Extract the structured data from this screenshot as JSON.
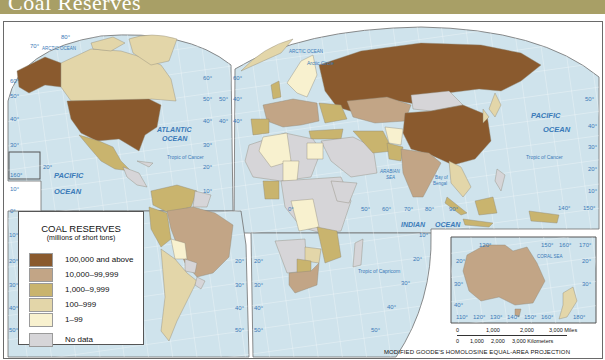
{
  "header": {
    "title": "Coal Reserves",
    "background_color": "#a89f66"
  },
  "legend": {
    "title": "COAL RESERVES",
    "subtitle": "(millions of short tons)",
    "items": [
      {
        "label": "100,000 and above",
        "color": "#8a5a2e"
      },
      {
        "label": "10,000–99,999",
        "color": "#c2a586"
      },
      {
        "label": "1,000–9,999",
        "color": "#c9b46e"
      },
      {
        "label": "100–999",
        "color": "#e3d6a9"
      },
      {
        "label": "1–99",
        "color": "#f8f1cf"
      },
      {
        "label": "No data",
        "color": "#d6d5d8"
      }
    ]
  },
  "ocean_labels": {
    "arctic_west": "ARCTIC OCEAN",
    "arctic_east": "ARCTIC OCEAN",
    "atlantic_1": "ATLANTIC",
    "atlantic_2": "OCEAN",
    "pacific_west_1": "PACIFIC",
    "pacific_west_2": "OCEAN",
    "pacific_east_1": "PACIFIC",
    "pacific_east_2": "OCEAN",
    "indian_1": "INDIAN",
    "indian_2": "OCEAN",
    "arabian_sea_1": "ARABIAN",
    "arabian_sea_2": "SEA",
    "bay_of_bengal_1": "Bay of",
    "bay_of_bengal_2": "Bengal",
    "coral_sea": "CORAL SEA"
  },
  "line_labels": {
    "arctic_circle": "Arctic Circle",
    "tropic_cancer_west": "Tropic of Cancer",
    "tropic_cancer_east": "Tropic of Cancer",
    "tropic_capricorn": "Tropic of Capricorn"
  },
  "graticule_labels": {
    "west_lat": [
      "80°",
      "70°",
      "60°",
      "50°",
      "40°",
      "30°",
      "20°",
      "160°",
      "10°",
      "0°",
      "10°",
      "20°",
      "30°",
      "40°",
      "50°"
    ],
    "atlantic_lat": [
      "60°",
      "50°",
      "40°",
      "30°",
      "20°",
      "10°"
    ],
    "sa_east_lat": [
      "20°",
      "30°",
      "40°",
      "50°"
    ],
    "africa_west_lat": [
      "60°",
      "50°",
      "40°",
      "30°",
      "20°",
      "10°",
      "0°",
      "10°",
      "20°",
      "30°",
      "40°",
      "50°"
    ],
    "indian_lon": [
      "50°",
      "60°",
      "70°",
      "80°",
      "90°"
    ],
    "east_lat": [
      "50°",
      "40°",
      "30°",
      "20°",
      "10°"
    ],
    "east_lon": [
      "140°",
      "150°"
    ],
    "africa_south_lat": [
      "10°",
      "20°",
      "30°",
      "40°",
      "50°"
    ],
    "australia_top": [
      "120°",
      "150°",
      "160°",
      "170°"
    ],
    "australia_left": [
      "20°",
      "30°",
      "40°"
    ],
    "australia_right": [
      "20°",
      "30°"
    ],
    "australia_bottom": [
      "110°",
      "120°",
      "130°",
      "140°",
      "150°",
      "160°",
      "180°"
    ]
  },
  "scale_bar": {
    "miles_ticks": [
      "0",
      "1,000",
      "2,000",
      "3,000 Miles"
    ],
    "km_ticks": [
      "0",
      "1,000",
      "2,000",
      "3,000 Kilometers"
    ]
  },
  "projection": "MODIFIED GOODE'S HOMOLOSINE EQUAL-AREA PROJECTION",
  "colors": {
    "ocean": "#cfe3ec",
    "graticule": "#ffffff",
    "border": "#6e6e6e",
    "label": "#3a7ab8"
  }
}
